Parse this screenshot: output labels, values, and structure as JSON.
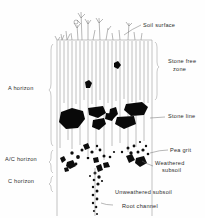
{
  "figure": {
    "background_color": "#fefefe",
    "ink_color": "#0d0d0d",
    "line_color": "#8d8d8d"
  },
  "horizon_labels": [
    {
      "id": "a-horizon",
      "text": "A horizon",
      "x": 8,
      "y": 90
    },
    {
      "id": "ac-horizon",
      "text": "A/C horizon",
      "x": 5,
      "y": 161
    },
    {
      "id": "c-horizon",
      "text": "C horizon",
      "x": 8,
      "y": 183
    }
  ],
  "feature_labels": [
    {
      "id": "soil-surface",
      "text": "Soil surface",
      "x": 143,
      "y": 27
    },
    {
      "id": "stone-free-zone-line1",
      "text": "Stone free",
      "x": 168,
      "y": 63
    },
    {
      "id": "stone-free-zone-line2",
      "text": "zone",
      "x": 173,
      "y": 71
    },
    {
      "id": "stone-line",
      "text": "Stone line",
      "x": 168,
      "y": 118
    },
    {
      "id": "pea-grit",
      "text": "Pea grit",
      "x": 170,
      "y": 152
    },
    {
      "id": "weathered-subsoil-line1",
      "text": "Weathered",
      "x": 155,
      "y": 165
    },
    {
      "id": "weathered-subsoil-line2",
      "text": "subsoil",
      "x": 162,
      "y": 172
    },
    {
      "id": "unweathered-subsoil",
      "text": "Unweathered subsoil",
      "x": 115,
      "y": 194
    },
    {
      "id": "root-channel",
      "text": "Root channel",
      "x": 122,
      "y": 208
    }
  ],
  "zones": {
    "stone_free_zone": {
      "top": 40,
      "bottom": 100
    },
    "stone_line": {
      "top": 100,
      "bottom": 135
    },
    "pea_grit_zone": {
      "top": 140,
      "bottom": 175
    },
    "root_channel_zone": {
      "top": 150,
      "bottom": 216
    }
  }
}
